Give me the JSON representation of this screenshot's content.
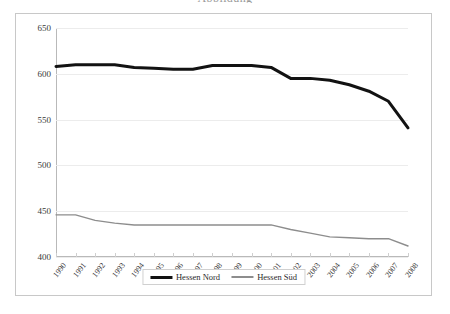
{
  "page": {
    "title_remnant": "Abbildung"
  },
  "chart_data": {
    "type": "line",
    "title": "",
    "subtitle": "",
    "xlabel": "",
    "ylabel": "",
    "grid": true,
    "legend_position": "bottom",
    "ylim": [
      400,
      650
    ],
    "yticks": [
      400,
      450,
      500,
      550,
      600,
      650
    ],
    "categories": [
      "1990",
      "1991",
      "1992",
      "1993",
      "1994",
      "1995",
      "1996",
      "1997",
      "1998",
      "1999",
      "2000",
      "2001",
      "2002",
      "2003",
      "2004",
      "2005",
      "2006",
      "2007",
      "2008"
    ],
    "series": [
      {
        "name": "Hessen Nord",
        "color": "#121212",
        "width": 3,
        "values": [
          608,
          610,
          610,
          610,
          607,
          606,
          605,
          605,
          609,
          609,
          609,
          607,
          595,
          595,
          593,
          588,
          581,
          570,
          541
        ]
      },
      {
        "name": "Hessen Süd",
        "color": "#8d8d8d",
        "width": 1.4,
        "values": [
          446,
          446,
          440,
          437,
          435,
          435,
          435,
          435,
          435,
          435,
          435,
          435,
          430,
          426,
          422,
          421,
          420,
          420,
          412
        ]
      }
    ]
  },
  "legend": {
    "items": [
      {
        "label": "Hessen Nord"
      },
      {
        "label": "Hessen Süd"
      }
    ]
  }
}
